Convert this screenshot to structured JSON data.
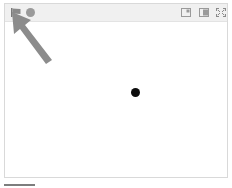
{
  "stage": {
    "controls": {
      "green_flag": "flag-icon",
      "stop": "stop-icon",
      "small_stage": "small-stage-icon",
      "normal_stage": "normal-stage-icon",
      "fullscreen": "fullscreen-icon"
    },
    "sprite": {
      "shape": "dot",
      "color": "#0d0d0d"
    },
    "annotation": {
      "type": "arrow",
      "target": "green-flag",
      "color": "#8c8c8c"
    }
  },
  "colors": {
    "header_bg": "#f0f0f0",
    "border": "#d9d9d9",
    "icon_gray": "#9a9a9a"
  }
}
